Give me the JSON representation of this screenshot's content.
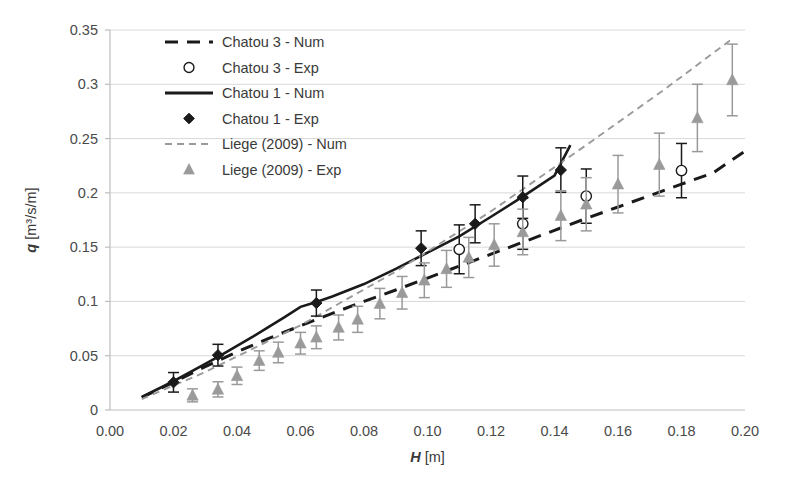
{
  "chart_data": {
    "type": "scatter",
    "title": "",
    "xlabel": "H [m]",
    "ylabel": "q [m³/s/m]",
    "xlim": [
      0.0,
      0.2
    ],
    "ylim": [
      0.0,
      0.35
    ],
    "xticks": [
      "0.00",
      "0.02",
      "0.04",
      "0.06",
      "0.08",
      "0.10",
      "0.12",
      "0.14",
      "0.16",
      "0.18",
      "0.20"
    ],
    "xtick_values": [
      0.0,
      0.02,
      0.04,
      0.06,
      0.08,
      0.1,
      0.12,
      0.14,
      0.16,
      0.18,
      0.2
    ],
    "yticks": [
      "0",
      "0.05",
      "0.1",
      "0.15",
      "0.2",
      "0.25",
      "0.3",
      "0.35"
    ],
    "ytick_values": [
      0,
      0.05,
      0.1,
      0.15,
      0.2,
      0.25,
      0.3,
      0.35
    ],
    "grid": "horizontal",
    "legend_position": "upper-left-inside",
    "series": [
      {
        "name": "Chatou 3 - Num",
        "kind": "line",
        "style": "dashed",
        "color": "#1a1a1a",
        "x": [
          0.01,
          0.02,
          0.03,
          0.04,
          0.05,
          0.06,
          0.07,
          0.08,
          0.09,
          0.1,
          0.11,
          0.12,
          0.13,
          0.14,
          0.15,
          0.16,
          0.17,
          0.18,
          0.19,
          0.2
        ],
        "y": [
          0.0115,
          0.0255,
          0.04,
          0.0535,
          0.066,
          0.0775,
          0.089,
          0.1,
          0.1105,
          0.1215,
          0.1325,
          0.1435,
          0.1545,
          0.1655,
          0.1765,
          0.187,
          0.1975,
          0.208,
          0.2185,
          0.2385
        ]
      },
      {
        "name": "Chatou 3 - Exp",
        "kind": "markers",
        "marker": "open-circle",
        "color": "#1a1a1a",
        "x": [
          0.11,
          0.13,
          0.15,
          0.18
        ],
        "y": [
          0.148,
          0.1715,
          0.197,
          0.2205
        ],
        "yerr_low": [
          0.0225,
          0.0235,
          0.025,
          0.025
        ],
        "yerr_high": [
          0.0225,
          0.0235,
          0.025,
          0.025
        ]
      },
      {
        "name": "Chatou 1 - Num",
        "kind": "line",
        "style": "solid",
        "color": "#1a1a1a",
        "x": [
          0.01,
          0.02,
          0.03,
          0.035,
          0.04,
          0.045,
          0.05,
          0.055,
          0.06,
          0.065,
          0.07,
          0.08,
          0.09,
          0.1,
          0.11,
          0.12,
          0.13,
          0.14,
          0.145
        ],
        "y": [
          0.012,
          0.0265,
          0.0425,
          0.0505,
          0.059,
          0.0675,
          0.0765,
          0.0855,
          0.095,
          0.0995,
          0.1045,
          0.116,
          0.13,
          0.145,
          0.16,
          0.178,
          0.1965,
          0.216,
          0.244
        ]
      },
      {
        "name": "Chatou 1 - Exp",
        "kind": "markers",
        "marker": "filled-diamond",
        "color": "#1a1a1a",
        "x": [
          0.02,
          0.034,
          0.065,
          0.098,
          0.115,
          0.13,
          0.142
        ],
        "y": [
          0.0255,
          0.0505,
          0.0985,
          0.149,
          0.1715,
          0.196,
          0.221
        ],
        "yerr_low": [
          0.009,
          0.01,
          0.012,
          0.016,
          0.0175,
          0.0195,
          0.0205
        ],
        "yerr_high": [
          0.009,
          0.01,
          0.012,
          0.016,
          0.0175,
          0.0195,
          0.0205
        ]
      },
      {
        "name": "Liege (2009) - Num",
        "kind": "line",
        "style": "fine-dashed",
        "color": "#9a9a9a",
        "x": [
          0.01,
          0.03,
          0.06,
          0.09,
          0.12,
          0.15,
          0.175,
          0.196
        ],
        "y": [
          0.01,
          0.035,
          0.078,
          0.1275,
          0.183,
          0.244,
          0.296,
          0.342
        ]
      },
      {
        "name": "Liege (2009) - Exp",
        "kind": "markers",
        "marker": "filled-triangle",
        "color": "#9a9a9a",
        "x": [
          0.026,
          0.034,
          0.04,
          0.047,
          0.053,
          0.06,
          0.065,
          0.072,
          0.078,
          0.085,
          0.092,
          0.099,
          0.106,
          0.113,
          0.121,
          0.13,
          0.142,
          0.15,
          0.16,
          0.173,
          0.185,
          0.196
        ],
        "y": [
          0.0135,
          0.019,
          0.0315,
          0.0455,
          0.053,
          0.0615,
          0.067,
          0.076,
          0.0835,
          0.098,
          0.108,
          0.1195,
          0.13,
          0.1405,
          0.152,
          0.164,
          0.179,
          0.1895,
          0.208,
          0.226,
          0.269,
          0.304
        ],
        "yerr_low": [
          0.006,
          0.007,
          0.008,
          0.009,
          0.0095,
          0.01,
          0.0105,
          0.0115,
          0.012,
          0.014,
          0.015,
          0.016,
          0.017,
          0.0185,
          0.0195,
          0.021,
          0.023,
          0.0245,
          0.0265,
          0.029,
          0.031,
          0.033
        ],
        "yerr_high": [
          0.006,
          0.007,
          0.008,
          0.009,
          0.0095,
          0.01,
          0.0105,
          0.0115,
          0.012,
          0.014,
          0.015,
          0.016,
          0.017,
          0.0185,
          0.0195,
          0.021,
          0.023,
          0.0245,
          0.0265,
          0.029,
          0.031,
          0.033
        ]
      }
    ],
    "legend": [
      {
        "label": "Chatou 3 - Num",
        "marker": "dashed-line",
        "color": "#1a1a1a"
      },
      {
        "label": "Chatou 3 - Exp",
        "marker": "open-circle",
        "color": "#1a1a1a"
      },
      {
        "label": "Chatou 1 - Num",
        "marker": "solid-line",
        "color": "#1a1a1a"
      },
      {
        "label": "Chatou 1 - Exp",
        "marker": "filled-diamond",
        "color": "#1a1a1a"
      },
      {
        "label": "Liege (2009) - Num",
        "marker": "fine-dashed-line",
        "color": "#9a9a9a"
      },
      {
        "label": "Liege (2009) - Exp",
        "marker": "filled-triangle",
        "color": "#9a9a9a"
      }
    ],
    "colors": {
      "dark": "#1a1a1a",
      "gray": "#9a9a9a",
      "grid": "#d9d9d9",
      "axis": "#bdbdbd",
      "text": "#3a3a3a",
      "background": "#ffffff"
    }
  },
  "axis": {
    "x_title_symbol": "H",
    "x_title_unit": "[m]",
    "y_title_symbol": "q",
    "y_title_unit": "[m³/s/m]"
  }
}
